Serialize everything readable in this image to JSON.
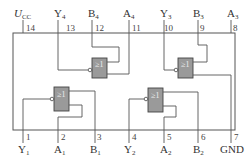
{
  "gate_symbol": "≥1",
  "colors": {
    "gate_fill": "#9a9a9a",
    "wire": "#555555",
    "text": "#333333"
  },
  "top_pins": [
    {
      "num": "14",
      "name": "U",
      "sub": "CC"
    },
    {
      "num": "13",
      "name": "Y",
      "sub": "4"
    },
    {
      "num": "12",
      "name": "B",
      "sub": "4"
    },
    {
      "num": "11",
      "name": "A",
      "sub": "4"
    },
    {
      "num": "10",
      "name": "Y",
      "sub": "3"
    },
    {
      "num": "9",
      "name": "B",
      "sub": "3"
    },
    {
      "num": "8",
      "name": "A",
      "sub": "3"
    }
  ],
  "bottom_pins": [
    {
      "num": "1",
      "name": "Y",
      "sub": "1"
    },
    {
      "num": "2",
      "name": "A",
      "sub": "1"
    },
    {
      "num": "3",
      "name": "B",
      "sub": "1"
    },
    {
      "num": "4",
      "name": "Y",
      "sub": "2"
    },
    {
      "num": "5",
      "name": "A",
      "sub": "2"
    },
    {
      "num": "6",
      "name": "B",
      "sub": "2"
    },
    {
      "num": "7",
      "name": "GND",
      "sub": ""
    }
  ]
}
